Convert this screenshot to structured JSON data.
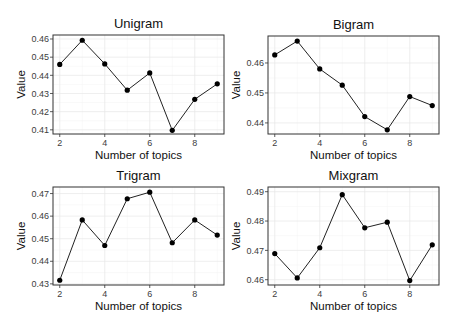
{
  "figure": {
    "width": 457,
    "height": 330
  },
  "chart_data": [
    {
      "type": "line",
      "title": "Unigram",
      "xlabel": "Number of topics",
      "ylabel": "Value",
      "x": [
        2,
        3,
        4,
        5,
        6,
        7,
        8,
        9
      ],
      "values": [
        0.446,
        0.4593,
        0.4463,
        0.4318,
        0.4413,
        0.4097,
        0.4268,
        0.4353
      ],
      "xticks": [
        2,
        4,
        6,
        8
      ],
      "yticks": [
        0.41,
        0.42,
        0.43,
        0.44,
        0.45,
        0.46
      ],
      "ytick_labels": [
        "0.41",
        "0.42",
        "0.43",
        "0.44",
        "0.45",
        "0.46"
      ],
      "xlim": [
        1.7,
        9.3
      ],
      "ylim": [
        0.4077,
        0.4622
      ],
      "grid": true,
      "panel": {
        "left": 53,
        "top": 35,
        "right": 224,
        "bottom": 134
      }
    },
    {
      "type": "line",
      "title": "Bigram",
      "xlabel": "Number of topics",
      "ylabel": "Value",
      "x": [
        2,
        3,
        4,
        5,
        6,
        7,
        8,
        9
      ],
      "values": [
        0.4627,
        0.4673,
        0.458,
        0.4526,
        0.4421,
        0.4377,
        0.4488,
        0.4458
      ],
      "xticks": [
        2,
        4,
        6,
        8
      ],
      "yticks": [
        0.44,
        0.45,
        0.46
      ],
      "ytick_labels": [
        "0.44",
        "0.45",
        "0.46"
      ],
      "xlim": [
        1.7,
        9.3
      ],
      "ylim": [
        0.4363,
        0.469
      ],
      "grid": true,
      "panel": {
        "left": 268,
        "top": 36,
        "right": 439,
        "bottom": 134
      }
    },
    {
      "type": "line",
      "title": "Trigram",
      "xlabel": "Number of topics",
      "ylabel": "Value",
      "x": [
        2,
        3,
        4,
        5,
        6,
        7,
        8,
        9
      ],
      "values": [
        0.4316,
        0.4583,
        0.447,
        0.4677,
        0.4706,
        0.4482,
        0.4583,
        0.4516
      ],
      "xticks": [
        2,
        4,
        6,
        8
      ],
      "yticks": [
        0.43,
        0.44,
        0.45,
        0.46,
        0.47
      ],
      "ytick_labels": [
        "0.43",
        "0.44",
        "0.45",
        "0.46",
        "0.47"
      ],
      "xlim": [
        1.7,
        9.3
      ],
      "ylim": [
        0.4295,
        0.4729
      ],
      "grid": true,
      "panel": {
        "left": 53,
        "top": 187,
        "right": 224,
        "bottom": 285
      }
    },
    {
      "type": "line",
      "title": "Mixgram",
      "xlabel": "Number of topics",
      "ylabel": "Value",
      "x": [
        2,
        3,
        4,
        5,
        6,
        7,
        8,
        9
      ],
      "values": [
        0.4689,
        0.4606,
        0.4709,
        0.489,
        0.4777,
        0.4796,
        0.4597,
        0.4719
      ],
      "xticks": [
        2,
        4,
        6,
        8
      ],
      "yticks": [
        0.46,
        0.47,
        0.48,
        0.49
      ],
      "ytick_labels": [
        "0.46",
        "0.47",
        "0.48",
        "0.49"
      ],
      "xlim": [
        1.7,
        9.3
      ],
      "ylim": [
        0.4582,
        0.4916
      ],
      "grid": true,
      "panel": {
        "left": 268,
        "top": 187,
        "right": 439,
        "bottom": 285
      }
    }
  ]
}
